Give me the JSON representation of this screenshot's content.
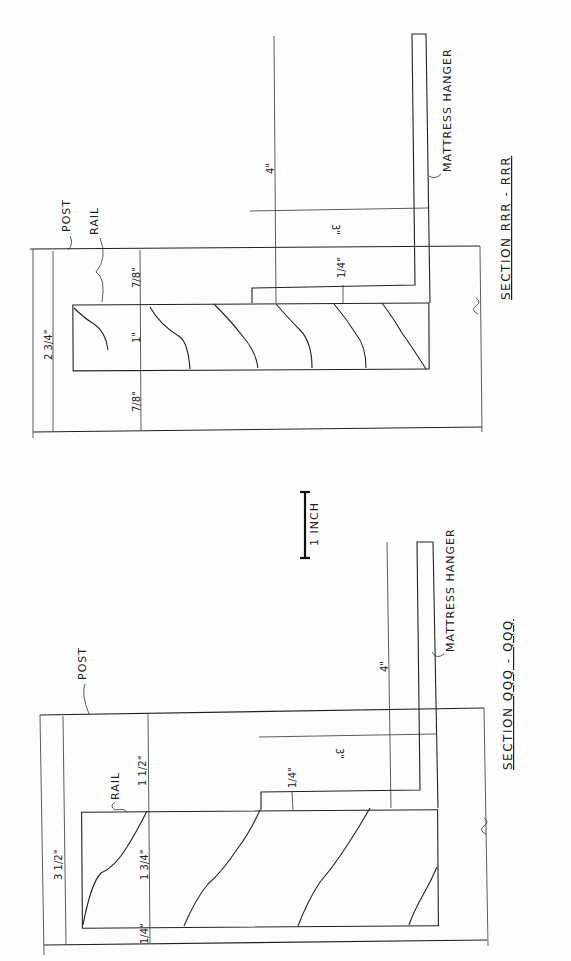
{
  "drawing": {
    "orientation": "rotated 90° counter-clockwise (text reads bottom-to-top)",
    "scale_bar": {
      "label": "1 INCH"
    },
    "sections": [
      {
        "id": "rrr",
        "title": "SECTION RRR - RRR",
        "labels": {
          "post": "POST",
          "rail": "RAIL",
          "hanger": "MATTRESS HANGER"
        },
        "dimensions": {
          "overall": "2 3/4\"",
          "top_gap": "7/8\"",
          "rail_thickness": "1\"",
          "bottom_gap": "7/8\"",
          "hanger_height": "4\"",
          "hanger_offset": "3\"",
          "hanger_thickness": "1/4\""
        }
      },
      {
        "id": "qqq",
        "title": "SECTION QQQ - QQQ",
        "labels": {
          "post": "POST",
          "rail": "RAIL",
          "hanger": "MATTRESS HANGER"
        },
        "dimensions": {
          "overall": "3 1/2\"",
          "top_gap": "1 1/2\"",
          "rail_thickness": "1 3/4\"",
          "bottom_gap": "1/4\"",
          "hanger_height": "4\"",
          "hanger_offset": "3\"",
          "hanger_thickness": "1/4\""
        }
      }
    ]
  }
}
